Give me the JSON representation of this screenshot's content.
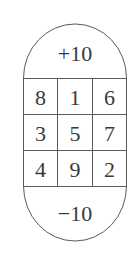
{
  "diagram": {
    "top_label": "+10",
    "bottom_label": "−10",
    "grid": [
      [
        "8",
        "1",
        "6"
      ],
      [
        "3",
        "5",
        "7"
      ],
      [
        "4",
        "9",
        "2"
      ]
    ],
    "stroke_color": "#5a5a5a",
    "text_color": "#3a3a3a"
  }
}
